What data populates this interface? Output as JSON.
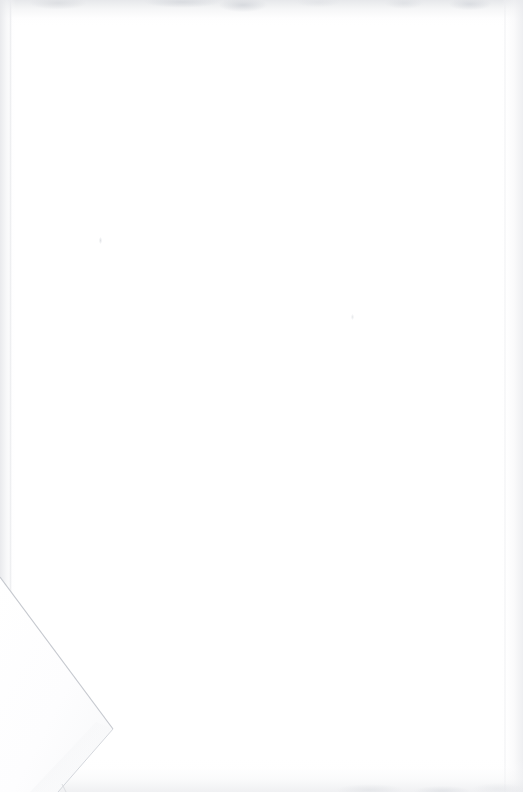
{
  "page": {
    "kind": "scanned-document-page",
    "content_state": "blank",
    "width_px": 523,
    "height_px": 792,
    "orientation": "portrait",
    "paper_color": "#ffffff",
    "visible_text": "",
    "accessible_description": "Blank scanned page with a folded lower-left corner"
  },
  "artifacts": {
    "edge_shadow_color": "#e7e8eb",
    "crease_line_color": "#c9ccd1",
    "fold_flap_color": "#fdfdfe",
    "fold_shadow_color": "#eceef1",
    "speck_color": "#e2e4e8"
  },
  "corner_fold": {
    "name": "bottom-left-corner-fold",
    "crease_start_x": 0,
    "crease_start_y": 605,
    "crease_apex_x": 113,
    "crease_apex_y": 757,
    "return_edge_end_x": 58,
    "return_edge_end_y": 792
  },
  "specks": [
    {
      "x": 99,
      "y": 237
    },
    {
      "x": 351,
      "y": 314
    }
  ]
}
